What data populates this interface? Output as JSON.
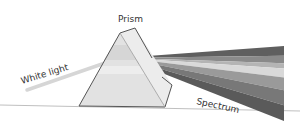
{
  "diagram": {
    "labels": {
      "prism": "Prism",
      "white_light": "White light",
      "spectrum": "Spectrum"
    },
    "colors": {
      "ground_line": "#bfbfbf",
      "white_light_beam": "#d6d6d6",
      "prism_face_front": "#e2e2e2",
      "prism_face_side": "#ececec",
      "prism_edge": "#555555",
      "spectrum_bands": [
        "#5f5f5f",
        "#8a8a8a",
        "#b4b4b4",
        "#d9d9d9",
        "#9a9a9a",
        "#787878",
        "#5a5a5a"
      ]
    }
  }
}
